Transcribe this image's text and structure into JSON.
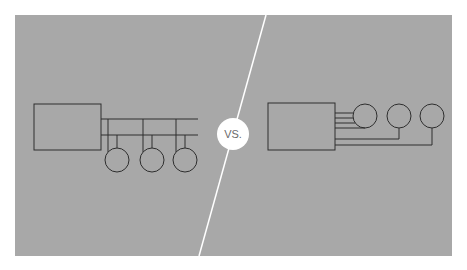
{
  "diagram": {
    "background_color": "#ffffff",
    "panel_color": "#a8a8a8",
    "line_color": "#2e2e2e",
    "divider_color": "#ffffff",
    "vs_badge": {
      "label": "VS.",
      "fill": "#ffffff",
      "text_color": "#6a6a6a"
    },
    "left": {
      "name": "bus-topology",
      "controller_box": {
        "x": 34,
        "y": 104,
        "w": 67,
        "h": 46
      },
      "bus_lines_y": [
        119,
        135
      ],
      "devices": [
        {
          "drop_x_top": 108,
          "drop_x_bottom": 117,
          "circle_cx": 117,
          "circle_cy": 160,
          "r": 12
        },
        {
          "drop_x_top": 143,
          "drop_x_bottom": 152,
          "circle_cx": 152,
          "circle_cy": 160,
          "r": 12
        },
        {
          "drop_x_top": 176,
          "drop_x_bottom": 185,
          "circle_cx": 185,
          "circle_cy": 160,
          "r": 12
        }
      ]
    },
    "right": {
      "name": "point-to-point-wiring",
      "controller_box": {
        "x": 268,
        "y": 103,
        "w": 67,
        "h": 47
      },
      "devices": [
        {
          "circle_cx": 365,
          "circle_cy": 116,
          "r": 12
        },
        {
          "circle_cx": 399,
          "circle_cy": 116,
          "r": 12
        },
        {
          "circle_cx": 432,
          "circle_cy": 116,
          "r": 12
        }
      ]
    }
  }
}
